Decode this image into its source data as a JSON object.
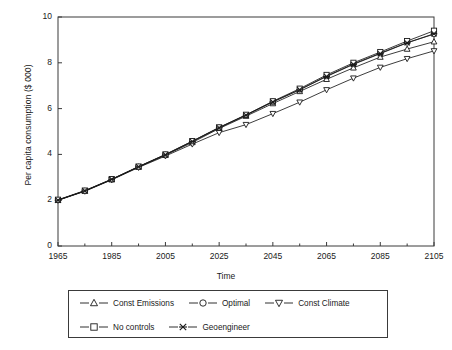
{
  "chart_data": {
    "type": "line",
    "title": "",
    "xlabel": "Time",
    "ylabel": "Per capita consumption ($ 000)",
    "xlim": [
      1965,
      2105
    ],
    "ylim": [
      0,
      10
    ],
    "xticks": [
      1965,
      1985,
      2005,
      2025,
      2045,
      2065,
      2085,
      2105
    ],
    "yticks": [
      0,
      2,
      4,
      6,
      8,
      10
    ],
    "xminor_step": 10,
    "grid": false,
    "legend_position": "below-plot",
    "x": [
      1965,
      1975,
      1985,
      1995,
      2005,
      2015,
      2025,
      2035,
      2045,
      2055,
      2065,
      2075,
      2085,
      2095,
      2105
    ],
    "series": [
      {
        "name": "Const Emissions",
        "marker": "triangle-up",
        "values": [
          2.0,
          2.4,
          2.9,
          3.45,
          3.97,
          4.52,
          5.13,
          5.67,
          6.22,
          6.75,
          7.28,
          7.78,
          8.25,
          8.6,
          8.92
        ]
      },
      {
        "name": "Optimal",
        "marker": "circle",
        "values": [
          2.0,
          2.41,
          2.91,
          3.46,
          3.99,
          4.57,
          5.17,
          5.72,
          6.3,
          6.83,
          7.42,
          7.95,
          8.42,
          8.88,
          9.25
        ]
      },
      {
        "name": "Const Climate",
        "marker": "triangle-down",
        "values": [
          2.0,
          2.39,
          2.89,
          3.43,
          3.93,
          4.45,
          4.95,
          5.3,
          5.78,
          6.28,
          6.82,
          7.33,
          7.8,
          8.18,
          8.52
        ]
      },
      {
        "name": "No controls",
        "marker": "square",
        "values": [
          2.02,
          2.42,
          2.92,
          3.47,
          4.0,
          4.58,
          5.18,
          5.73,
          6.32,
          6.87,
          7.47,
          8.0,
          8.47,
          8.95,
          9.4
        ]
      },
      {
        "name": "Geoengineer",
        "marker": "x",
        "values": [
          2.0,
          2.41,
          2.91,
          3.46,
          3.98,
          4.56,
          5.16,
          5.71,
          6.29,
          6.82,
          7.4,
          7.93,
          8.4,
          8.87,
          9.27
        ]
      }
    ]
  },
  "axis": {
    "y_tick_labels": [
      "0",
      "2",
      "4",
      "6",
      "8",
      "10"
    ],
    "x_tick_labels": [
      "1965",
      "1985",
      "2005",
      "2025",
      "2045",
      "2065",
      "2085",
      "2105"
    ],
    "x_title": "Time",
    "y_title": "Per capita consumption ($ 000)"
  },
  "legend": {
    "rows": [
      [
        {
          "label": "Const Emissions",
          "marker": "triangle-up"
        },
        {
          "label": "Optimal",
          "marker": "circle"
        },
        {
          "label": "Const Climate",
          "marker": "triangle-down"
        }
      ],
      [
        {
          "label": "No controls",
          "marker": "square"
        },
        {
          "label": "Geoengineer",
          "marker": "x"
        }
      ]
    ]
  },
  "colors": {
    "line": "#1a1a1a",
    "frame": "#3a3a3a",
    "background": "#ffffff"
  }
}
